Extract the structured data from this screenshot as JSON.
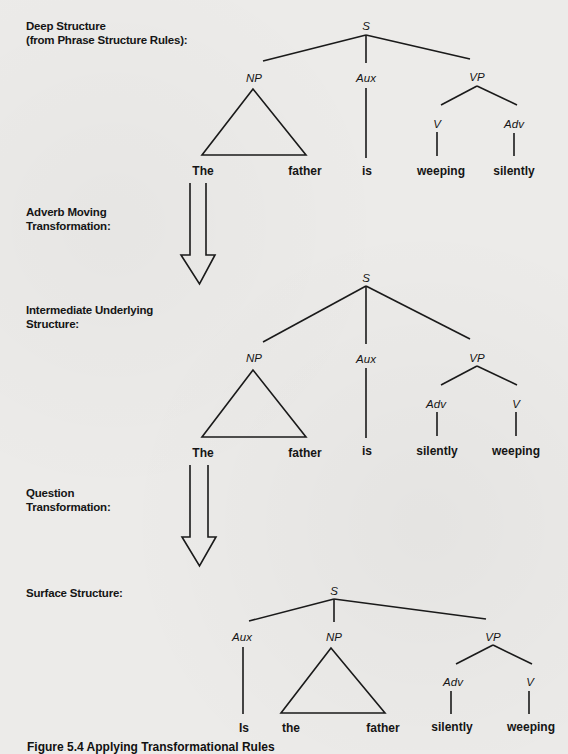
{
  "stages": [
    {
      "label_lines": [
        "Deep Structure",
        "(from Phrase Structure Rules):"
      ]
    },
    {
      "label_lines": [
        "Adverb Moving",
        "Transformation:"
      ]
    },
    {
      "label_lines": [
        "Intermediate Underlying",
        "Structure:"
      ]
    },
    {
      "label_lines": [
        "Question",
        "Transformation:"
      ]
    },
    {
      "label_lines": [
        "Surface Structure:"
      ]
    }
  ],
  "trees": [
    {
      "name": "deep-structure",
      "root": "S",
      "nodes": {
        "np": "NP",
        "aux": "Aux",
        "vp": "VP",
        "vp_left": "V",
        "vp_right": "Adv"
      },
      "words": {
        "np_left": "The",
        "np_right": "father",
        "aux": "is",
        "vp_left": "weeping",
        "vp_right": "silently"
      }
    },
    {
      "name": "intermediate-structure",
      "root": "S",
      "nodes": {
        "np": "NP",
        "aux": "Aux",
        "vp": "VP",
        "vp_left": "Adv",
        "vp_right": "V"
      },
      "words": {
        "np_left": "The",
        "np_right": "father",
        "aux": "is",
        "vp_left": "silently",
        "vp_right": "weeping"
      }
    },
    {
      "name": "surface-structure",
      "root": "S",
      "nodes": {
        "aux": "Aux",
        "np": "NP",
        "vp": "VP",
        "vp_left": "Adv",
        "vp_right": "V"
      },
      "words": {
        "aux": "Is",
        "np_left": "the",
        "np_right": "father",
        "vp_left": "silently",
        "vp_right": "weeping"
      }
    }
  ],
  "caption": "Figure 5.4  Applying Transformational Rules"
}
